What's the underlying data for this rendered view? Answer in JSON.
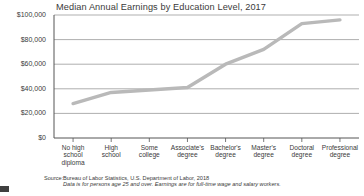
{
  "chart_data": {
    "type": "line",
    "title": "Median Annual Earnings by Education Level, 2017",
    "xlabel": "",
    "ylabel": "",
    "categories": [
      "No high\nschool\ndiploma",
      "High\nschool",
      "Some\ncollege",
      "Associate's\ndegree",
      "Bachelor's\ndegree",
      "Master's\ndegree",
      "Doctoral\ndegree",
      "Professional\ndegree"
    ],
    "values": [
      28000,
      37000,
      39000,
      41000,
      60000,
      72000,
      93000,
      96000
    ],
    "ylim": [
      0,
      100000
    ],
    "yticks": [
      0,
      20000,
      40000,
      60000,
      80000,
      100000
    ],
    "ytick_labels": [
      "$0",
      "$20,000",
      "$40,000",
      "$60,000",
      "$80,000",
      "$100,000"
    ],
    "grid": true,
    "legend": "none",
    "line_color": "#b9b9b9",
    "grid_color": "#8c8c8c",
    "axis_color": "#555555"
  },
  "source": {
    "label": "Source:",
    "line1": "Bureau of Labor Statistics, U.S. Department of Labor, 2018",
    "line2": "Data is for persons age 25 and over. Earnings are for full-time wage and salary workers."
  }
}
